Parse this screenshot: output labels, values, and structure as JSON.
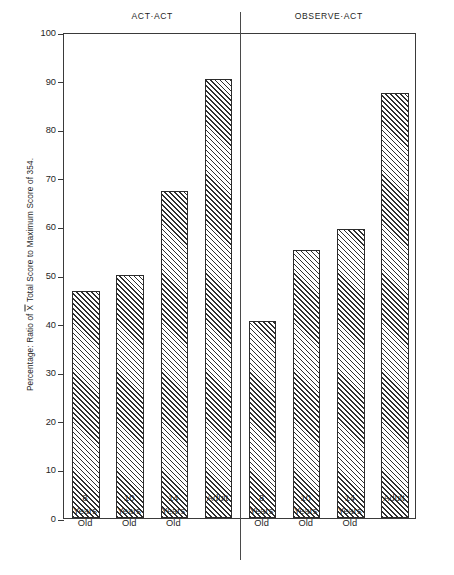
{
  "chart_data": {
    "type": "bar",
    "title": "",
    "xlabel": "",
    "ylabel": "Percentage:  Ratio of X Total Score to Maximum Score of 354.",
    "ylabel_parts": {
      "before": "Percentage:  Ratio of ",
      "xbar": "X",
      "after": " Total Score to Maximum Score of 354."
    },
    "ylim": [
      0,
      100
    ],
    "yticks": [
      0,
      10,
      20,
      30,
      40,
      50,
      60,
      70,
      80,
      90,
      100
    ],
    "ytick_labels": [
      "0",
      "10",
      "20",
      "30",
      "40",
      "50",
      "60",
      "70",
      "80",
      "90",
      "100"
    ],
    "grid": false,
    "legend": "none",
    "categories": [
      "8 Years Old",
      "10 Years Old",
      "14 Years Old",
      "Adult"
    ],
    "category_lines": [
      [
        "8",
        "Years",
        "Old"
      ],
      [
        "10",
        "Years",
        "Old"
      ],
      [
        "14",
        "Years",
        "Old"
      ],
      [
        "Adult"
      ]
    ],
    "panels": [
      {
        "name": "ACT-ACT",
        "title": "ACT·ACT",
        "values": [
          46.8,
          50.0,
          67.2,
          90.3
        ]
      },
      {
        "name": "OBSERVE-ACT",
        "title": "OBSERVE·ACT",
        "values": [
          40.6,
          55.2,
          59.4,
          87.4
        ]
      }
    ],
    "bar_style": {
      "fill": "diagonal-hatch",
      "hatch_direction": "forward-slash",
      "hatch_color": "#2f2f2f",
      "background_color": "#ffffff",
      "edge_color": "#2b2b2b"
    },
    "axis_color": "#3a3a3a",
    "divider_color": "#4a4a4a",
    "text_color": "#1f1f1f"
  }
}
